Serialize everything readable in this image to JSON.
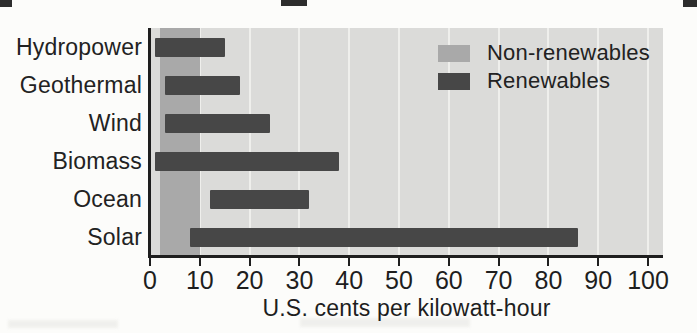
{
  "legend": {
    "items": [
      {
        "label": "Non-renewables",
        "color": "#a9a9a9"
      },
      {
        "label": "Renewables",
        "color": "#474747"
      }
    ]
  },
  "chart_data": {
    "type": "bar",
    "orientation": "horizontal",
    "title": "",
    "xlabel": "U.S. cents per kilowatt-hour",
    "xlim": [
      0,
      100
    ],
    "xticks": [
      0,
      10,
      20,
      30,
      40,
      50,
      60,
      70,
      80,
      90,
      100
    ],
    "grid": true,
    "legend_position": "top-right",
    "categories": [
      "Hydropower",
      "Geothermal",
      "Wind",
      "Biomass",
      "Ocean",
      "Solar"
    ],
    "bars": [
      {
        "category": "Hydropower",
        "range_cents": [
          1,
          15
        ]
      },
      {
        "category": "Geothermal",
        "range_cents": [
          3,
          18
        ]
      },
      {
        "category": "Wind",
        "range_cents": [
          3,
          24
        ]
      },
      {
        "category": "Biomass",
        "range_cents": [
          1,
          38
        ]
      },
      {
        "category": "Ocean",
        "range_cents": [
          12,
          32
        ]
      },
      {
        "category": "Solar",
        "range_cents": [
          8,
          86
        ]
      }
    ],
    "non_renewables_band": {
      "label": "Non-renewables",
      "range_cents": [
        2,
        10
      ]
    },
    "colors": {
      "plot_background": "#dbdbd9",
      "page_background": "#fcfcfa",
      "non_renewables": "#a9a9a9",
      "renewables": "#474747",
      "gridline": "#efefec",
      "axis": "#1e1e1e",
      "text": "#222222"
    }
  }
}
